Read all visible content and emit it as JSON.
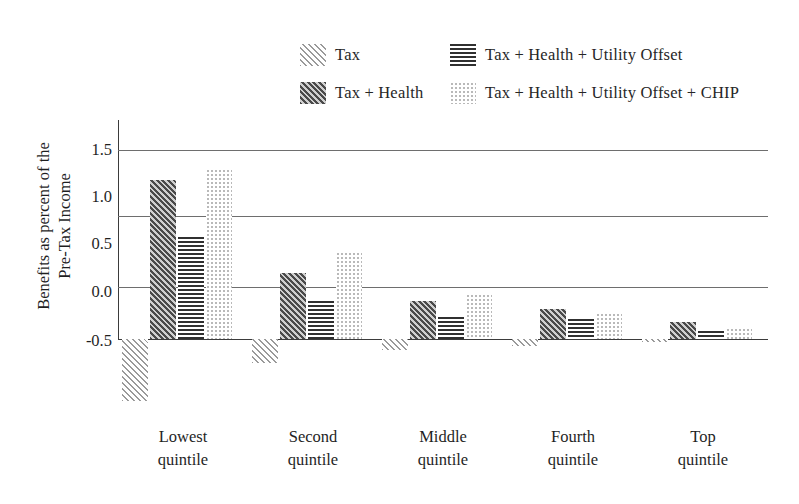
{
  "chart_data": {
    "type": "bar",
    "title": "",
    "subtitle": "",
    "xlabel": "",
    "ylabel": "Benefits as percent of the\nPre-Tax Income",
    "categories": [
      "Lowest\nquintile",
      "Second\nquintile",
      "Middle\nquintile",
      "Fourth\nquintile",
      "Top\nquintile"
    ],
    "series": [
      {
        "name": "Tax",
        "pattern": "diagonal-light-hatch",
        "values": [
          -1.15,
          -0.75,
          -0.62,
          -0.57,
          -0.53
        ]
      },
      {
        "name": "Tax + Health",
        "pattern": "diagonal-dark-hatch",
        "values": [
          1.18,
          0.2,
          -0.1,
          -0.18,
          -0.32
        ]
      },
      {
        "name": "Tax +  Health + Utility Offset",
        "pattern": "horizontal-lines",
        "values": [
          0.58,
          -0.1,
          -0.27,
          -0.29,
          -0.42
        ]
      },
      {
        "name": "Tax +  Health + Utility Offset + CHIP",
        "pattern": "dotted-light",
        "values": [
          1.3,
          0.42,
          -0.02,
          -0.22,
          -0.38
        ]
      }
    ],
    "yticks": [
      1.5,
      1.0,
      0.5,
      0.0,
      -0.5
    ],
    "ytick_labels": [
      "1.5",
      "1.0",
      "0.5",
      "0.0",
      "-0.5"
    ],
    "ylim": [
      -1.25,
      1.5
    ],
    "gridlines": [
      1.5,
      0.8,
      0.05,
      -0.5
    ],
    "grid": true,
    "legend_position": "top-center",
    "legend_entries": [
      "Tax",
      "Tax + Health",
      "Tax +  Health + Utility Offset",
      "Tax +  Health + Utility Offset + CHIP"
    ]
  },
  "colors": {
    "background": "#ffffff",
    "gridline": "#6e6e6e",
    "axis": "#3b3b3b",
    "text": "#1f1f1f",
    "tax_hatch": "#9a9a9a",
    "taxhealth_hatch": "#4a4a4a",
    "utility_lines": "#303030",
    "chip_dots": "#b9b9b9"
  }
}
